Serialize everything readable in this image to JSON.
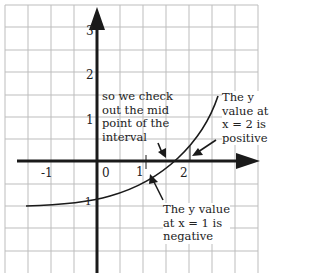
{
  "diagram": {
    "type": "function-graph-on-grid",
    "axes": {
      "x_ticks": [
        "-1",
        "0",
        "1",
        "2"
      ],
      "y_ticks": [
        "3",
        "2",
        "1",
        "-1"
      ]
    },
    "annotations": {
      "midpoint_note": [
        "so we check",
        "out the mid",
        "point of the",
        "interval"
      ],
      "x2_note": [
        "The y",
        "value at",
        "x = 2 is",
        "positive"
      ],
      "x1_note": [
        "The y value",
        "at x = 1 is",
        "negative"
      ]
    },
    "colors": {
      "grid": "#b8b8b8",
      "axis": "#1a1a1a",
      "curve": "#1a1a1a",
      "background": "#ffffff"
    }
  }
}
